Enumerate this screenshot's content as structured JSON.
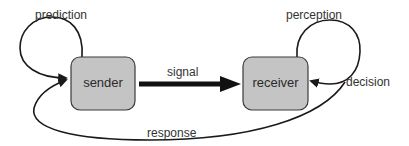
{
  "diagram": {
    "type": "flow-diagram",
    "nodes": [
      {
        "id": "sender",
        "label": "sender"
      },
      {
        "id": "receiver",
        "label": "receiver"
      }
    ],
    "edges": [
      {
        "id": "signal",
        "from": "sender",
        "to": "receiver",
        "label": "signal"
      },
      {
        "id": "prediction",
        "from": "sender",
        "to": "sender",
        "label": "prediction"
      },
      {
        "id": "perception",
        "from": "receiver",
        "to": "receiver",
        "label": "perception"
      },
      {
        "id": "decision",
        "from": "receiver",
        "to": "receiver",
        "label": "decision"
      },
      {
        "id": "response",
        "from": "receiver",
        "to": "sender",
        "label": "response"
      }
    ],
    "colors": {
      "node_fill": "#c4c4c4",
      "node_stroke": "#3a3a3a",
      "edge": "#1a1a1a",
      "text": "#2a2a2a"
    }
  }
}
